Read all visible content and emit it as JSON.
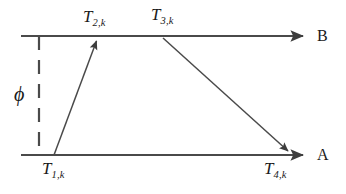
{
  "figure": {
    "background_color": "#ffffff",
    "line_color": "#4a4a4a",
    "text_color": "#1a1a1a",
    "width": 346,
    "height": 194
  },
  "timelines": [
    {
      "id": "timeline-b",
      "label": "B",
      "y": 36,
      "x_start": 21,
      "x_end": 310,
      "arrow": "right"
    },
    {
      "id": "timeline-a",
      "label": "A",
      "y": 155,
      "x_start": 21,
      "x_end": 310,
      "arrow": "right"
    }
  ],
  "offset_marker": {
    "symbol": "ϕ",
    "name": "phi",
    "x": 39,
    "y_top": 36,
    "y_bottom": 155,
    "style": "dashed"
  },
  "events": [
    {
      "id": "T1",
      "base": "T",
      "sub": "1,k",
      "x": 54,
      "y": 155,
      "timeline": "A"
    },
    {
      "id": "T2",
      "base": "T",
      "sub": "2,k",
      "x": 96,
      "y": 36,
      "timeline": "B"
    },
    {
      "id": "T3",
      "base": "T",
      "sub": "3,k",
      "x": 163,
      "y": 37,
      "timeline": "B"
    },
    {
      "id": "T4",
      "base": "T",
      "sub": "4,k",
      "x": 289,
      "y": 155,
      "timeline": "A"
    }
  ],
  "messages": [
    {
      "id": "msg-a-to-b",
      "from": "T1",
      "to": "T2",
      "x1": 54,
      "y1": 155,
      "x2": 96,
      "y2": 38,
      "arrow": "end"
    },
    {
      "id": "msg-b-to-a",
      "from": "T3",
      "to": "T4",
      "x1": 163,
      "y1": 38,
      "x2": 289,
      "y2": 154,
      "arrow": "end"
    }
  ],
  "labels": {
    "T1": {
      "base": "T",
      "sub": "1,k"
    },
    "T2": {
      "base": "T",
      "sub": "2,k"
    },
    "T3": {
      "base": "T",
      "sub": "3,k"
    },
    "T4": {
      "base": "T",
      "sub": "4,k"
    },
    "phi": "ϕ",
    "node_b": "B",
    "node_a": "A"
  }
}
